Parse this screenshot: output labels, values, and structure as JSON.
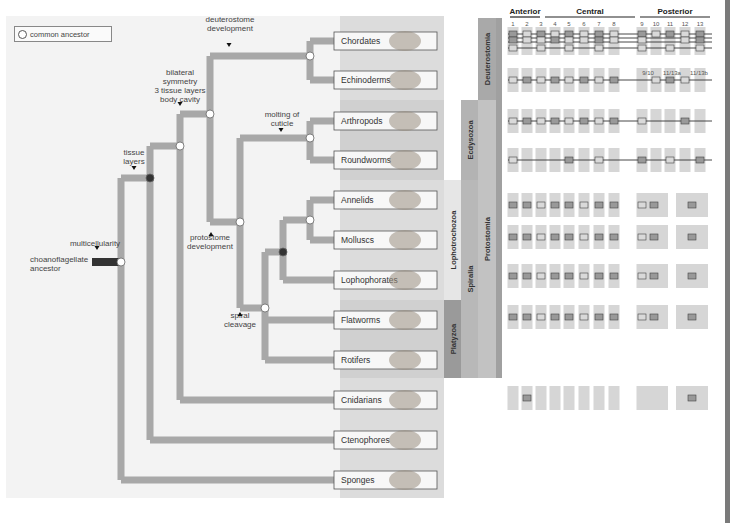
{
  "legend": {
    "label": "common ancestor"
  },
  "root": {
    "label_line1": "choanoflagellate",
    "label_line2": "ancestor"
  },
  "events": [
    {
      "id": "multicellularity",
      "lines": [
        "multicellularity"
      ]
    },
    {
      "id": "tissue",
      "lines": [
        "tissue",
        "layers"
      ]
    },
    {
      "id": "bilateral",
      "lines": [
        "bilateral",
        "symmetry",
        "3 tissue layers",
        "body cavity"
      ]
    },
    {
      "id": "deuterostome",
      "lines": [
        "deuterostome",
        "development"
      ]
    },
    {
      "id": "protostome",
      "lines": [
        "protostome",
        "development"
      ]
    },
    {
      "id": "molting",
      "lines": [
        "molting of",
        "cuticle"
      ]
    },
    {
      "id": "spiral",
      "lines": [
        "spiral",
        "cleavage"
      ]
    }
  ],
  "taxa": [
    {
      "name": "Chordates",
      "y": 41
    },
    {
      "name": "Echinoderms",
      "y": 80
    },
    {
      "name": "Arthropods",
      "y": 121
    },
    {
      "name": "Roundworms",
      "y": 160
    },
    {
      "name": "Annelids",
      "y": 200
    },
    {
      "name": "Molluscs",
      "y": 240
    },
    {
      "name": "Lophophorates",
      "y": 280
    },
    {
      "name": "Flatworms",
      "y": 320
    },
    {
      "name": "Rotifers",
      "y": 360
    },
    {
      "name": "Cnidarians",
      "y": 400
    },
    {
      "name": "Ctenophores",
      "y": 440
    },
    {
      "name": "Sponges",
      "y": 480
    }
  ],
  "clades": [
    {
      "name": "Deuterostomia",
      "x": 478,
      "y1": 18,
      "y2": 100,
      "w": 18,
      "color": "#a9a9a9"
    },
    {
      "name": "Ecdysozoa",
      "x": 461,
      "y1": 100,
      "y2": 180,
      "w": 17,
      "color": "#b3b3b3"
    },
    {
      "name": "Lophotrochozoa",
      "x": 444,
      "y1": 180,
      "y2": 300,
      "w": 17,
      "color": "#e6e6e6"
    },
    {
      "name": "Platyzoa",
      "x": 444,
      "y1": 300,
      "y2": 378,
      "w": 17,
      "color": "#9a9a9a"
    },
    {
      "name": "Spiralia",
      "x": 461,
      "y1": 180,
      "y2": 378,
      "w": 17,
      "color": "#b8b8b8"
    },
    {
      "name": "Protostomia",
      "x": 478,
      "y1": 100,
      "y2": 378,
      "w": 18,
      "color": "#c2c2c2"
    },
    {
      "name": "Bilateria",
      "x": 496,
      "y1": 18,
      "y2": 378,
      "w": 6,
      "color": "#a0a0a0"
    }
  ],
  "hox": {
    "headers": [
      {
        "label": "Anterior",
        "x1": 510,
        "x2": 540
      },
      {
        "label": "Central",
        "x1": 545,
        "x2": 635
      },
      {
        "label": "Posterior",
        "x1": 640,
        "x2": 710
      }
    ],
    "gene_numbers": [
      "1",
      "2",
      "3",
      "4",
      "5",
      "6",
      "7",
      "8",
      "9",
      "10",
      "11",
      "12",
      "13"
    ],
    "sub_labels": [
      "9/10",
      "11/13a",
      "11/13b"
    ],
    "rows": [
      {
        "taxon": "Chordates",
        "y": 40,
        "type": "multi"
      },
      {
        "taxon": "Echinoderms",
        "y": 80,
        "type": "line"
      },
      {
        "taxon": "Arthropods",
        "y": 121,
        "type": "line"
      },
      {
        "taxon": "Roundworms",
        "y": 160,
        "type": "line"
      },
      {
        "taxon": "Annelids",
        "y": 205,
        "type": "boxes"
      },
      {
        "taxon": "Molluscs",
        "y": 237,
        "type": "boxes"
      },
      {
        "taxon": "Lophophorates",
        "y": 276,
        "type": "boxes"
      },
      {
        "taxon": "Flatworms",
        "y": 317,
        "type": "boxes"
      },
      {
        "taxon": "Cnidarians",
        "y": 398,
        "type": "boxes"
      }
    ]
  },
  "colors": {
    "branch": "#a8a8a8",
    "panel_bg": "#f3f3f3",
    "taxa_bg": "#dcdcdc",
    "node_open": "#ffffff",
    "node_filled": "#333333",
    "root_bar": "#333333",
    "gene_dark": "#999999",
    "gene_light": "#d9d9d9",
    "gene_col": "#d6d6d6"
  }
}
